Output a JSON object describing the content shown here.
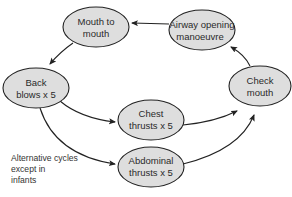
{
  "diagram": {
    "type": "cycle-flowchart",
    "colors": {
      "node_fill": "#dedede",
      "node_stroke": "#222222",
      "arrow": "#222222",
      "text": "#2a2a2a"
    },
    "nodes": [
      {
        "id": "mouth_to_mouth",
        "line1": "Mouth to",
        "line2": "mouth"
      },
      {
        "id": "airway_opening",
        "line1": "Airway opening",
        "line2": "manoeuvre"
      },
      {
        "id": "back_blows",
        "line1": "Back",
        "line2": "blows x 5"
      },
      {
        "id": "check_mouth",
        "line1": "Check",
        "line2": "mouth"
      },
      {
        "id": "chest_thrusts",
        "line1": "Chest",
        "line2": "thrusts x 5"
      },
      {
        "id": "abdominal_thrusts",
        "line1": "Abdominal",
        "line2": "thrusts x 5"
      }
    ],
    "edges": [
      {
        "from": "airway_opening",
        "to": "mouth_to_mouth"
      },
      {
        "from": "mouth_to_mouth",
        "to": "back_blows"
      },
      {
        "from": "back_blows",
        "to": "chest_thrusts"
      },
      {
        "from": "back_blows",
        "to": "abdominal_thrusts"
      },
      {
        "from": "chest_thrusts",
        "to": "check_mouth"
      },
      {
        "from": "abdominal_thrusts",
        "to": "check_mouth"
      },
      {
        "from": "check_mouth",
        "to": "airway_opening"
      }
    ],
    "note": {
      "line1": "Alternative cycles",
      "line2": "except in",
      "line3": "infants"
    }
  }
}
